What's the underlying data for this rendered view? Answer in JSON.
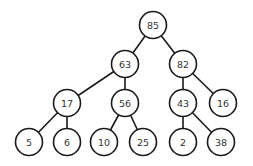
{
  "tree": {
    "radius": 13.5,
    "colors": {
      "stroke": "#1a1a1a",
      "fill": "#ffffff",
      "text": "#333333"
    },
    "nodes": [
      {
        "id": "n85",
        "label": "85",
        "x": 153,
        "y": 25
      },
      {
        "id": "n63",
        "label": "63",
        "x": 125,
        "y": 64
      },
      {
        "id": "n82",
        "label": "82",
        "x": 183,
        "y": 64
      },
      {
        "id": "n17",
        "label": "17",
        "x": 67,
        "y": 103
      },
      {
        "id": "n56",
        "label": "56",
        "x": 125,
        "y": 103
      },
      {
        "id": "n43",
        "label": "43",
        "x": 183,
        "y": 103
      },
      {
        "id": "n16",
        "label": "16",
        "x": 223,
        "y": 103
      },
      {
        "id": "n5",
        "label": "5",
        "x": 29,
        "y": 142
      },
      {
        "id": "n6",
        "label": "6",
        "x": 67,
        "y": 142
      },
      {
        "id": "n10",
        "label": "10",
        "x": 104,
        "y": 142
      },
      {
        "id": "n25",
        "label": "25",
        "x": 143,
        "y": 142
      },
      {
        "id": "n2",
        "label": "2",
        "x": 183,
        "y": 142
      },
      {
        "id": "n38",
        "label": "38",
        "x": 221,
        "y": 142
      }
    ],
    "edges": [
      [
        "n85",
        "n63"
      ],
      [
        "n85",
        "n82"
      ],
      [
        "n63",
        "n17"
      ],
      [
        "n63",
        "n56"
      ],
      [
        "n82",
        "n43"
      ],
      [
        "n82",
        "n16"
      ],
      [
        "n17",
        "n5"
      ],
      [
        "n17",
        "n6"
      ],
      [
        "n56",
        "n10"
      ],
      [
        "n56",
        "n25"
      ],
      [
        "n43",
        "n2"
      ],
      [
        "n43",
        "n38"
      ]
    ]
  }
}
